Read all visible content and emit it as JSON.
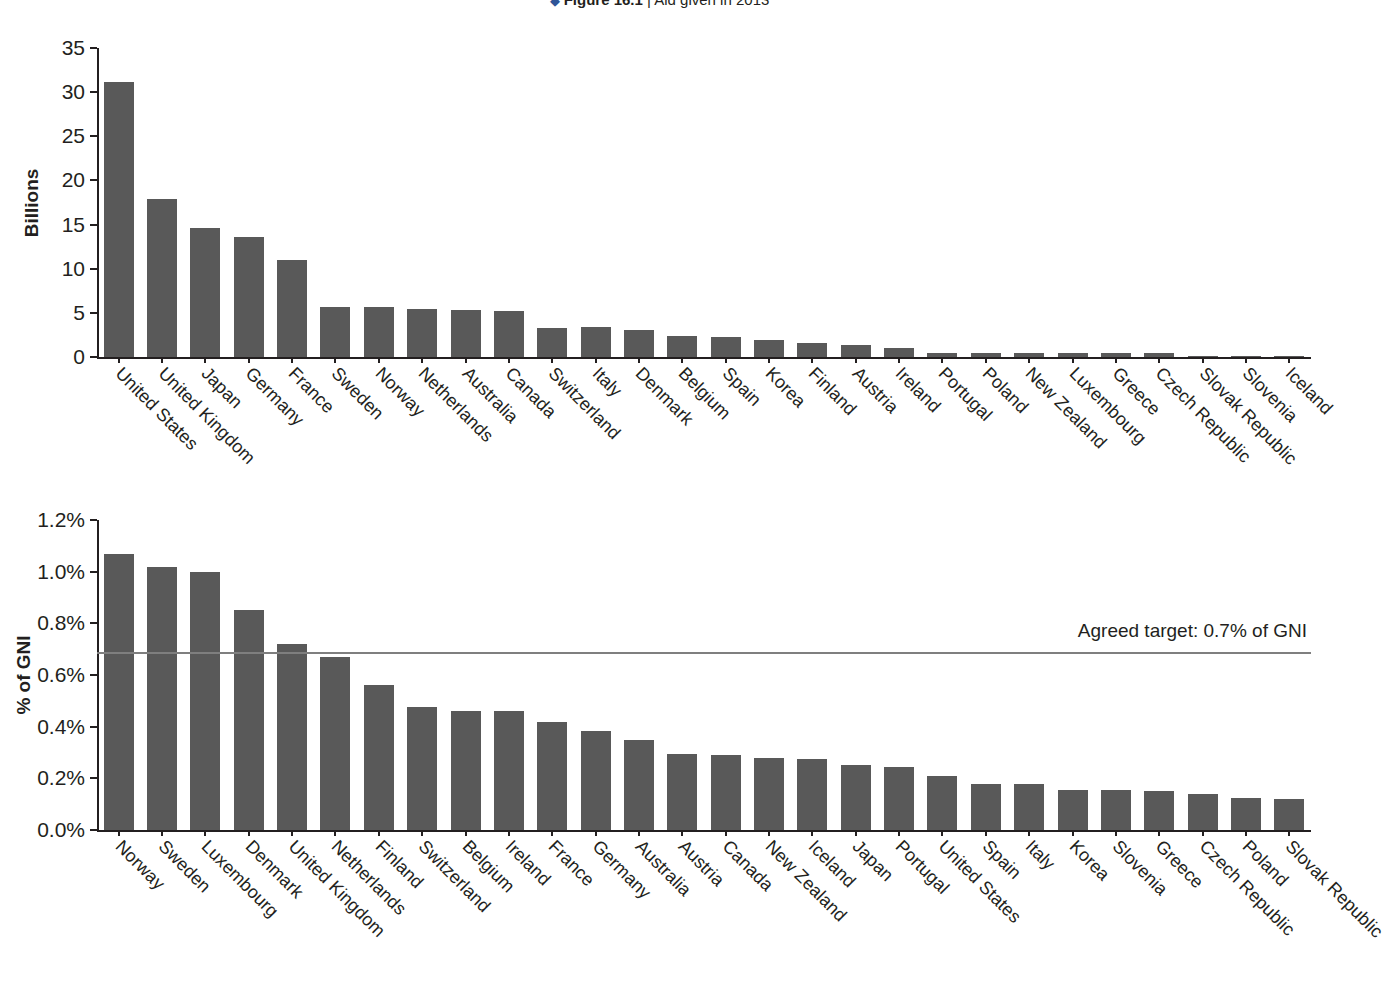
{
  "caption": {
    "marker": "◆",
    "number": "Figure 16.1",
    "separator": " | ",
    "text": "Aid given in 2013"
  },
  "chart_data": [
    {
      "type": "bar",
      "id": "aid-absolute",
      "title": "",
      "xlabel": "",
      "ylabel": "Billions",
      "ylim": [
        0,
        35
      ],
      "yticks": [
        0,
        5,
        10,
        15,
        20,
        25,
        30,
        35
      ],
      "ytick_labels": [
        "0",
        "5",
        "10",
        "15",
        "20",
        "25",
        "30",
        "35"
      ],
      "grid": false,
      "legend": null,
      "bar_color": "#595959",
      "categories": [
        "United States",
        "United Kingdom",
        "Japan",
        "Germany",
        "France",
        "Sweden",
        "Norway",
        "Netherlands",
        "Australia",
        "Canada",
        "Switzerland",
        "Italy",
        "Denmark",
        "Belgium",
        "Spain",
        "Korea",
        "Finland",
        "Austria",
        "Ireland",
        "Portugal",
        "Poland",
        "New Zealand",
        "Luxembourg",
        "Greece",
        "Czech Republic",
        "Slovak Republic",
        "Slovenia",
        "Iceland"
      ],
      "values": [
        31.1,
        17.9,
        14.6,
        13.6,
        11.0,
        5.7,
        5.7,
        5.4,
        5.3,
        5.2,
        3.3,
        3.4,
        3.1,
        2.4,
        2.3,
        1.9,
        1.6,
        1.4,
        1.0,
        0.5,
        0.5,
        0.5,
        0.4,
        0.5,
        0.5,
        0.1,
        0.1,
        0.1
      ]
    },
    {
      "type": "bar",
      "id": "aid-percent-gni",
      "title": "",
      "xlabel": "",
      "ylabel": "% of GNI",
      "ylim": [
        0.0,
        1.2
      ],
      "yticks": [
        0.0,
        0.2,
        0.4,
        0.6,
        0.8,
        1.0,
        1.2
      ],
      "ytick_labels": [
        "0.0%",
        "0.2%",
        "0.4%",
        "0.6%",
        "0.8%",
        "1.0%",
        "1.2%"
      ],
      "grid": false,
      "legend": null,
      "bar_color": "#595959",
      "annotation": {
        "label": "Agreed target: 0.7% of GNI",
        "value": 0.69,
        "line_color": "#7f7f7f"
      },
      "categories": [
        "Norway",
        "Sweden",
        "Luxembourg",
        "Denmark",
        "United Kingdom",
        "Netherlands",
        "Finland",
        "Switzerland",
        "Belgium",
        "Ireland",
        "France",
        "Germany",
        "Australia",
        "Austria",
        "Canada",
        "New Zealand",
        "Iceland",
        "Japan",
        "Portugal",
        "United States",
        "Spain",
        "Italy",
        "Korea",
        "Slovenia",
        "Greece",
        "Czech Republic",
        "Poland",
        "Slovak Republic"
      ],
      "values": [
        1.07,
        1.02,
        1.0,
        0.85,
        0.72,
        0.67,
        0.56,
        0.475,
        0.46,
        0.46,
        0.42,
        0.385,
        0.35,
        0.295,
        0.29,
        0.28,
        0.275,
        0.25,
        0.245,
        0.21,
        0.18,
        0.18,
        0.155,
        0.155,
        0.15,
        0.14,
        0.125,
        0.12
      ]
    }
  ]
}
